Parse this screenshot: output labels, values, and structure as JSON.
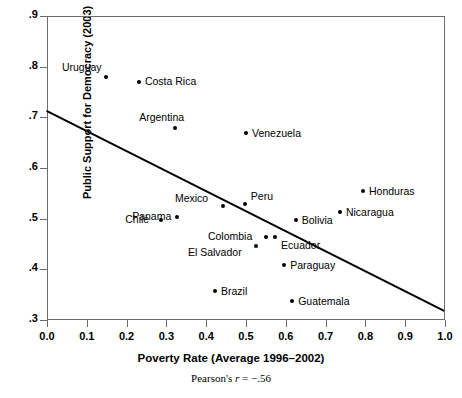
{
  "chart_data": {
    "type": "scatter",
    "title": "",
    "xlabel": "Poverty Rate (Average 1996–2002)",
    "ylabel": "Public Support for Democracy (2003)",
    "caption": "Pearson's r = −.56",
    "caption_prefix": "Pearson's ",
    "caption_stat": "r",
    "caption_value": " = −.56",
    "xlim": [
      0.0,
      1.0
    ],
    "ylim": [
      0.3,
      0.9
    ],
    "xticks": [
      "0.0",
      "0.1",
      "0.2",
      "0.3",
      "0.4",
      "0.5",
      "0.6",
      "0.7",
      "0.8",
      "0.9",
      "1.0"
    ],
    "xtick_values": [
      0.0,
      0.1,
      0.2,
      0.3,
      0.4,
      0.5,
      0.6,
      0.7,
      0.8,
      0.9,
      1.0
    ],
    "yticks": [
      ".9",
      ".8",
      ".7",
      ".6",
      ".5",
      ".4",
      ".3"
    ],
    "ytick_values": [
      0.9,
      0.8,
      0.7,
      0.6,
      0.5,
      0.4,
      0.3
    ],
    "grid": false,
    "legend": "none",
    "pearson_r": -0.56,
    "trendline": {
      "type": "linear",
      "x0": 0.0,
      "y0": 0.715,
      "x1": 1.0,
      "y1": 0.32
    },
    "points": [
      {
        "name": "Uruguay",
        "x": 0.148,
        "y": 0.78,
        "label_dx": -44,
        "label_dy": -16
      },
      {
        "name": "Costa Rica",
        "x": 0.231,
        "y": 0.77,
        "label_dx": 6,
        "label_dy": -7
      },
      {
        "name": "Argentina",
        "x": 0.322,
        "y": 0.678,
        "label_dx": -36,
        "label_dy": -17
      },
      {
        "name": "Venezuela",
        "x": 0.5,
        "y": 0.67,
        "label_dx": 6,
        "label_dy": -6
      },
      {
        "name": "Mexico",
        "x": 0.442,
        "y": 0.525,
        "label_dx": -48,
        "label_dy": -14
      },
      {
        "name": "Peru",
        "x": 0.497,
        "y": 0.528,
        "label_dx": 6,
        "label_dy": -14
      },
      {
        "name": "Honduras",
        "x": 0.794,
        "y": 0.555,
        "label_dx": 6,
        "label_dy": -6
      },
      {
        "name": "Nicaragua",
        "x": 0.736,
        "y": 0.513,
        "label_dx": 6,
        "label_dy": -6
      },
      {
        "name": "Bolivia",
        "x": 0.625,
        "y": 0.497,
        "label_dx": 6,
        "label_dy": -6
      },
      {
        "name": "Panama",
        "x": 0.327,
        "y": 0.503,
        "label_dx": -45,
        "label_dy": -7
      },
      {
        "name": "Chile",
        "x": 0.287,
        "y": 0.497,
        "label_dx": -36,
        "label_dy": -7
      },
      {
        "name": "Colombia",
        "x": 0.55,
        "y": 0.463,
        "label_dx": -58,
        "label_dy": -7
      },
      {
        "name": "Ecuador",
        "x": 0.573,
        "y": 0.463,
        "label_dx": 6,
        "label_dy": 2
      },
      {
        "name": "El Salvador",
        "x": 0.525,
        "y": 0.447,
        "label_dx": -68,
        "label_dy": 0
      },
      {
        "name": "Paraguay",
        "x": 0.596,
        "y": 0.408,
        "label_dx": 6,
        "label_dy": -6
      },
      {
        "name": "Brazil",
        "x": 0.422,
        "y": 0.357,
        "label_dx": 6,
        "label_dy": -6
      },
      {
        "name": "Guatemala",
        "x": 0.616,
        "y": 0.337,
        "label_dx": 6,
        "label_dy": -6
      }
    ]
  }
}
